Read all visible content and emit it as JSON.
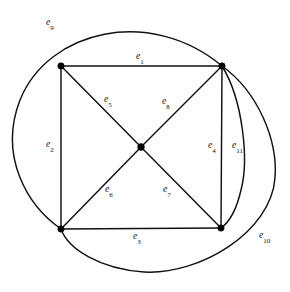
{
  "figure": {
    "background_color": "#ffffff",
    "stroke_color": "#111111",
    "vertex_color": "#000000"
  },
  "vertices": [
    {
      "id": "v-top-left",
      "name": "vertex-top-left",
      "x": 61,
      "y": 66
    },
    {
      "id": "v-top-right",
      "name": "vertex-top-right",
      "x": 222,
      "y": 66
    },
    {
      "id": "v-bottom-left",
      "name": "vertex-bottom-left",
      "x": 61,
      "y": 229
    },
    {
      "id": "v-bottom-right",
      "name": "vertex-bottom-right",
      "x": 221,
      "y": 228
    },
    {
      "id": "v-center",
      "name": "vertex-center",
      "x": 141,
      "y": 147
    }
  ],
  "edges": [
    {
      "id": "e1",
      "label": "e",
      "subscript": "1",
      "kind": "straight",
      "from": "v-top-left",
      "to": "v-top-right",
      "label_x": 136,
      "label_y": 52
    },
    {
      "id": "e2",
      "label": "e",
      "subscript": "2",
      "kind": "straight",
      "from": "v-top-left",
      "to": "v-bottom-left",
      "label_x": 46,
      "label_y": 140
    },
    {
      "id": "e3",
      "label": "e",
      "subscript": "3",
      "kind": "straight",
      "from": "v-bottom-left",
      "to": "v-bottom-right",
      "label_x": 133,
      "label_y": 232
    },
    {
      "id": "e4",
      "label": "e",
      "subscript": "4",
      "kind": "straight",
      "from": "v-top-right",
      "to": "v-bottom-right",
      "label_x": 208,
      "label_y": 141
    },
    {
      "id": "e5",
      "label": "e",
      "subscript": "5",
      "kind": "straight",
      "from": "v-top-left",
      "to": "v-center",
      "label_x": 104,
      "label_y": 95
    },
    {
      "id": "e6",
      "label": "e",
      "subscript": "6",
      "kind": "straight",
      "from": "v-center",
      "to": "v-bottom-left",
      "label_x": 105,
      "label_y": 185
    },
    {
      "id": "e7",
      "label": "e",
      "subscript": "7",
      "kind": "straight",
      "from": "v-center",
      "to": "v-bottom-right",
      "label_x": 163,
      "label_y": 185
    },
    {
      "id": "e8",
      "label": "e",
      "subscript": "8",
      "kind": "straight",
      "from": "v-center",
      "to": "v-top-right",
      "label_x": 162,
      "label_y": 97
    },
    {
      "id": "e9",
      "label": "e",
      "subscript": "9",
      "kind": "arc",
      "from": "v-top-right",
      "to": "v-bottom-left",
      "label_x": 46,
      "label_y": 18
    },
    {
      "id": "e10",
      "label": "e",
      "subscript": "10",
      "kind": "arc",
      "from": "v-top-right",
      "to": "v-bottom-left",
      "label_x": 259,
      "label_y": 231
    },
    {
      "id": "e11",
      "label": "e",
      "subscript": "11",
      "kind": "arc",
      "from": "v-top-right",
      "to": "v-bottom-right",
      "label_x": 232,
      "label_y": 141
    }
  ],
  "geometry": {
    "edge_e9_path": "M 222 66 C 150 6, 48 30, 20 100 C -2 157, 28 206, 61 229",
    "edge_e10_path": "M 222 66 C 258 92, 278 140, 275 178 C 271 232, 200 275, 144 272 C 100 269, 68 249, 61 229",
    "edge_e11_path": "M 222 66 C 243 100, 249 160, 241 190 C 236 212, 228 223, 221 228",
    "edge_e1_path": "M 61 66 L 222 66",
    "edge_e2_path": "M 61 66 L 61 229",
    "edge_e3_path": "M 61 229 L 221 228",
    "edge_e4_path": "M 222 66 L 221 228",
    "edge_e5_path": "M 61 66 L 141 147",
    "edge_e6_path": "M 141 147 L 61 229",
    "edge_e7_path": "M 141 147 L 221 228",
    "edge_e8_path": "M 141 147 L 222 66"
  },
  "chart_data": {
    "type": "diagram",
    "title": "",
    "nodes": [
      "v-top-left",
      "v-top-right",
      "v-bottom-left",
      "v-bottom-right",
      "v-center"
    ],
    "edge_labels": [
      "e1",
      "e2",
      "e3",
      "e4",
      "e5",
      "e6",
      "e7",
      "e8",
      "e9",
      "e10",
      "e11"
    ],
    "edge_count": 11,
    "node_count": 5
  }
}
